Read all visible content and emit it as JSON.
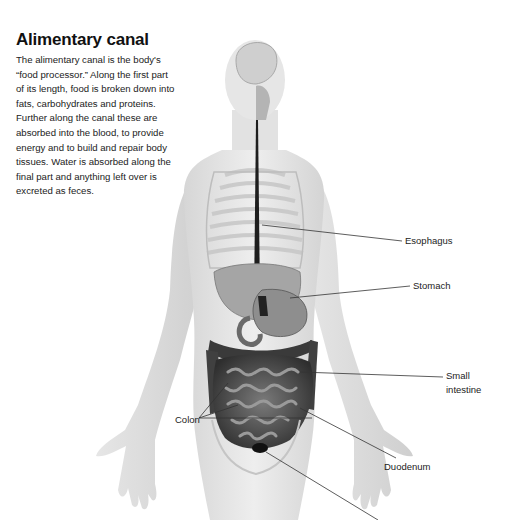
{
  "article": {
    "title": "Alimentary canal",
    "body": "The alimentary canal is the body's “food processor.” Along the first part of its length, food is broken down into fats, carbohydrates and proteins. Further along the canal these are absorbed into the blood, to provide energy and to build and repair body tissues. Water is absorbed along the final part and anything left over is excreted as feces."
  },
  "illustration": {
    "subject": "human-torso-digestive-system",
    "labels": {
      "esophagus": "Esophagus",
      "stomach": "Stomach",
      "small_intestine_line1": "Small",
      "small_intestine_line2": "intestine",
      "colon": "Colon",
      "duodenum": "Duodenum"
    },
    "colors": {
      "skin": "#e4e4e4",
      "organs_dark": "#3a3a3a",
      "organs_mid": "#8a8a8a",
      "leader_line": "#333333",
      "text": "#222222"
    }
  }
}
